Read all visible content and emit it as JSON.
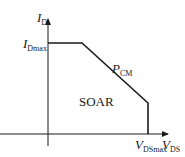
{
  "diagram": {
    "y_axis": {
      "symbol": "I",
      "subscript": "D"
    },
    "x_axis": {
      "symbol": "V",
      "subscript": "DS"
    },
    "y_limit": {
      "symbol": "I",
      "subscript": "Dmax"
    },
    "x_limit": {
      "symbol": "V",
      "subscript": "DSmax"
    },
    "power_limit": {
      "symbol": "P",
      "subscript": "CM"
    },
    "region_label": "SOAR",
    "colors": {
      "line": "#1a1a1a",
      "background": "#ffffff"
    }
  }
}
